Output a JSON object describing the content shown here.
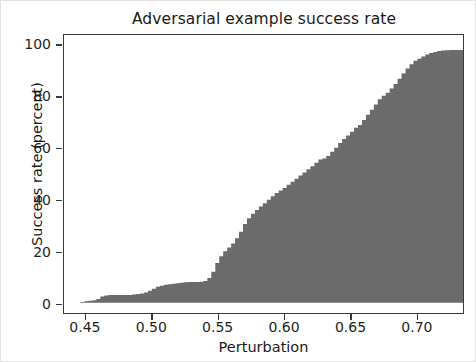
{
  "chart_data": {
    "type": "area",
    "title": "Adversarial example success rate",
    "xlabel": "Perturbation",
    "ylabel": "Success rate (percent)",
    "xlim": [
      0.4335,
      0.7355
    ],
    "ylim": [
      -4.0,
      104.0
    ],
    "xticks": [
      0.45,
      0.5,
      0.55,
      0.6,
      0.65,
      0.7
    ],
    "xticklabels": [
      "0.45",
      "0.50",
      "0.55",
      "0.60",
      "0.65",
      "0.70"
    ],
    "yticks": [
      0,
      20,
      40,
      60,
      80,
      100
    ],
    "yticklabels": [
      "0",
      "20",
      "40",
      "60",
      "80",
      "100"
    ],
    "grid": false,
    "legend": null,
    "fill_color": "#6b6b6b",
    "axes_color": "#3a3a3a",
    "background_color": "#ffffff",
    "series": [
      {
        "name": "cumulative success rate",
        "x": [
          0.443,
          0.446,
          0.449,
          0.452,
          0.455,
          0.458,
          0.461,
          0.464,
          0.467,
          0.47,
          0.473,
          0.476,
          0.479,
          0.482,
          0.485,
          0.488,
          0.491,
          0.494,
          0.497,
          0.5,
          0.503,
          0.506,
          0.509,
          0.512,
          0.515,
          0.518,
          0.521,
          0.524,
          0.527,
          0.53,
          0.533,
          0.536,
          0.539,
          0.542,
          0.545,
          0.548,
          0.551,
          0.554,
          0.557,
          0.56,
          0.563,
          0.566,
          0.569,
          0.572,
          0.575,
          0.578,
          0.581,
          0.584,
          0.587,
          0.59,
          0.593,
          0.596,
          0.599,
          0.602,
          0.605,
          0.608,
          0.611,
          0.614,
          0.617,
          0.62,
          0.623,
          0.626,
          0.629,
          0.632,
          0.635,
          0.638,
          0.641,
          0.644,
          0.647,
          0.65,
          0.653,
          0.656,
          0.659,
          0.662,
          0.665,
          0.668,
          0.671,
          0.674,
          0.677,
          0.68,
          0.683,
          0.686,
          0.689,
          0.692,
          0.695,
          0.698,
          0.701,
          0.704,
          0.707,
          0.71,
          0.713,
          0.716,
          0.719,
          0.722,
          0.725,
          0.728,
          0.731,
          0.7355
        ],
        "y": [
          0.0,
          0.3,
          0.6,
          0.8,
          1.0,
          1.4,
          2.4,
          2.8,
          3.0,
          3.0,
          3.0,
          3.0,
          3.0,
          3.0,
          3.2,
          3.4,
          3.6,
          4.0,
          4.6,
          5.4,
          6.2,
          6.6,
          7.0,
          7.2,
          7.4,
          7.6,
          7.8,
          7.9,
          8.0,
          8.0,
          8.0,
          8.1,
          8.4,
          9.6,
          12.0,
          15.4,
          18.0,
          20.0,
          21.4,
          23.0,
          25.0,
          27.6,
          30.6,
          32.8,
          34.6,
          36.0,
          37.4,
          38.6,
          40.0,
          41.4,
          42.6,
          43.6,
          44.6,
          45.8,
          47.0,
          48.2,
          49.4,
          50.6,
          51.8,
          53.0,
          54.4,
          55.6,
          56.0,
          57.0,
          58.6,
          60.2,
          62.0,
          63.6,
          65.0,
          66.4,
          68.0,
          69.0,
          71.0,
          73.0,
          75.0,
          77.0,
          79.0,
          80.4,
          81.6,
          83.2,
          85.0,
          87.0,
          89.0,
          91.0,
          92.6,
          94.0,
          94.8,
          95.6,
          96.4,
          97.0,
          97.4,
          97.8,
          98.0,
          98.1,
          98.2,
          98.2,
          98.2,
          98.2
        ]
      }
    ]
  },
  "figure": {
    "title": "Adversarial example success rate",
    "xlabel": "Perturbation",
    "ylabel": "Success rate (percent)"
  }
}
